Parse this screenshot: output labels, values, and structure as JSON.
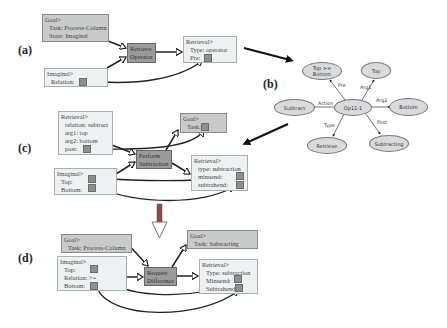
{
  "panels": {
    "a": {
      "label": "(a)",
      "goal": {
        "title": "Goal>",
        "rows": [
          "Task: Process-Column",
          "State: Imaginal"
        ]
      },
      "imaginal": {
        "title": "Imaginal>",
        "rows": [
          "Relation:"
        ]
      },
      "operator": {
        "line1": "Retrieve",
        "line2": "Operator"
      },
      "retrieval": {
        "title": "Retrieval>",
        "rows": [
          "Type: operator",
          "Pre:"
        ]
      }
    },
    "b": {
      "label": "(b)",
      "center": "Op11-1",
      "nodes": [
        {
          "id": "pre",
          "text": "Top >= Bottom",
          "edge": "Pre"
        },
        {
          "id": "arg1",
          "text": "Top",
          "edge": "Arg1"
        },
        {
          "id": "arg2",
          "text": "Bottom",
          "edge": "Arg2"
        },
        {
          "id": "action",
          "text": "Subtract",
          "edge": "Action"
        },
        {
          "id": "type",
          "text": "Retrieve",
          "edge": "Type"
        },
        {
          "id": "post",
          "text": "Subtracting",
          "edge": "Post"
        }
      ]
    },
    "c": {
      "label": "(c)",
      "retrieval_in": {
        "title": "Retrieval>",
        "rows": [
          "relation: subtract",
          "arg1: top",
          "arg2: bottom",
          "post:"
        ]
      },
      "goal": {
        "title": "Goal>",
        "rows": [
          "Task:"
        ]
      },
      "operator": {
        "line1": "Perform",
        "line2": "Subtraction"
      },
      "imaginal": {
        "title": "Imaginal>",
        "rows": [
          "Top:",
          "Bottom:"
        ]
      },
      "retrieval_out": {
        "title": "Retrieval>",
        "rows": [
          "type: subtraction",
          "minuend:",
          "subtrahend:"
        ]
      }
    },
    "d": {
      "label": "(d)",
      "goal_in": {
        "title": "Goal>",
        "rows": [
          "Task: Process-Column"
        ]
      },
      "goal_out": {
        "title": "Goal>",
        "rows": [
          "Task: Subtracting"
        ]
      },
      "imaginal": {
        "title": "Imaginal>",
        "rows": [
          "Top:",
          "Relation: >=",
          "Bottom:"
        ]
      },
      "operator": {
        "line1": "Request",
        "line2": "Difference"
      },
      "retrieval": {
        "title": "Retrieval>",
        "rows": [
          "Type: subtraction",
          "Minuend:",
          "Subtrahend:"
        ]
      }
    }
  },
  "colors": {
    "light_box": "#eef1f1",
    "mid_box": "#c9cbcb",
    "dark_box": "#9b9b9b",
    "ellipse": "#d8dadb",
    "arrow": "#1a1a1a",
    "transition_arrow": "#8a3a3a"
  }
}
